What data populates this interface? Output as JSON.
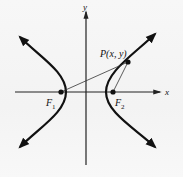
{
  "diagram": {
    "type": "hyperbola-foci",
    "axes": {
      "x_label": "x",
      "y_label": "y"
    },
    "foci": [
      {
        "name": "F1",
        "label_main": "F",
        "label_sub": "1"
      },
      {
        "name": "F2",
        "label_main": "F",
        "label_sub": "2"
      }
    ],
    "point": {
      "label": "P(x, y)"
    },
    "colors": {
      "curve": "#111111",
      "axis": "#222222",
      "segment": "#333333",
      "background": "#f5f5f5"
    }
  }
}
